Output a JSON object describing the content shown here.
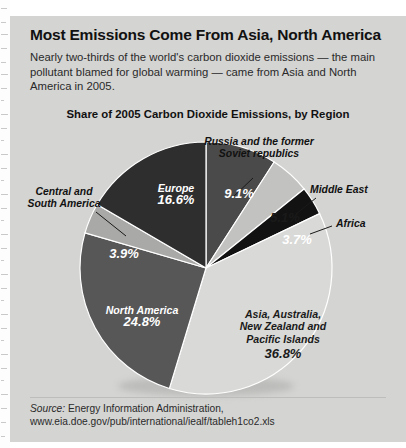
{
  "headline": "Most Emissions Come From Asia, North America",
  "deck": "Nearly two-thirds of the world's carbon dioxide emissions — the main pollutant blamed for global warming — came from Asia and North America in 2005.",
  "source": {
    "label": "Source:",
    "organization": "Energy Information Administration,",
    "url": "www.eia.doe.gov/pub/international/iealf/tableh1co2.xls"
  },
  "chart_data": {
    "type": "pie",
    "title": "Share of 2005 Carbon Dioxide Emissions, by Region",
    "start_angle_deg": 0,
    "direction": "clockwise",
    "units": "percent",
    "categories": [
      "Russia and the former Soviet republics",
      "Middle East",
      "Africa",
      "Asia, Australia, New Zealand and Pacific Islands",
      "North America",
      "Central and South America",
      "Europe"
    ],
    "values": [
      9.1,
      5.1,
      3.7,
      36.8,
      24.8,
      3.9,
      16.6
    ],
    "slices": [
      {
        "name": "Russia and the former Soviet republics",
        "short": "",
        "value": 9.1,
        "value_label": "9.1%",
        "color": "#4a4a4a",
        "label_style": "callout",
        "text_on": "dark"
      },
      {
        "name": "Middle East",
        "short": "",
        "value": 5.1,
        "value_label": "5.1%",
        "color": "#c2c2c0",
        "label_style": "callout",
        "text_on": "light"
      },
      {
        "name": "Africa",
        "short": "",
        "value": 3.7,
        "value_label": "3.7%",
        "color": "#121212",
        "label_style": "callout",
        "text_on": "dark"
      },
      {
        "name": "Asia, Australia, New Zealand and Pacific Islands",
        "short": "Asia, Australia,\nNew Zealand and\nPacific Islands",
        "value": 36.8,
        "value_label": "36.8%",
        "color": "#d9d9d7",
        "label_style": "inside",
        "text_on": "light"
      },
      {
        "name": "North America",
        "short": "North America",
        "value": 24.8,
        "value_label": "24.8%",
        "color": "#575757",
        "label_style": "inside",
        "text_on": "dark"
      },
      {
        "name": "Central and South America",
        "short": "",
        "value": 3.9,
        "value_label": "3.9%",
        "color": "#a9a9a7",
        "label_style": "callout",
        "text_on": "dark"
      },
      {
        "name": "Europe",
        "short": "Europe",
        "value": 16.6,
        "value_label": "16.6%",
        "color": "#2e2e2e",
        "label_style": "inside",
        "text_on": "dark"
      }
    ],
    "callouts": [
      {
        "text": "Russia and the former\nSoviet republics",
        "for": "Russia and the former Soviet republics"
      },
      {
        "text": "Middle East",
        "for": "Middle East"
      },
      {
        "text": "Africa",
        "for": "Africa"
      },
      {
        "text": "Central and\nSouth America",
        "for": "Central and South America"
      }
    ]
  },
  "labels": {
    "russia_callout_l1": "Russia and the former",
    "russia_callout_l2": "Soviet republics",
    "middle_east_callout": "Middle East",
    "africa_callout": "Africa",
    "csa_callout_l1": "Central and",
    "csa_callout_l2": "South America",
    "russia_pct": "9.1%",
    "middle_east_pct": "5.1%",
    "africa_pct": "3.7%",
    "europe_name": "Europe",
    "europe_pct": "16.6%",
    "csa_pct": "3.9%",
    "na_name": "North America",
    "na_pct": "24.8%",
    "asia_l1": "Asia, Australia,",
    "asia_l2": "New Zealand and",
    "asia_l3": "Pacific Islands",
    "asia_pct": "36.8%"
  }
}
